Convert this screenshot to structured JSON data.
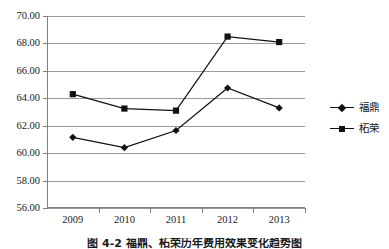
{
  "chart_data": {
    "type": "line",
    "title": "",
    "subtitle": "",
    "xlabel": "",
    "ylabel": "",
    "categories": [
      "2009",
      "2010",
      "2011",
      "2012",
      "2013"
    ],
    "series": [
      {
        "name": "福鼎",
        "marker": "diamond",
        "color": "#111111",
        "values": [
          61.15,
          60.4,
          61.65,
          64.75,
          63.3
        ]
      },
      {
        "name": "柘荣",
        "marker": "square",
        "color": "#111111",
        "values": [
          64.3,
          63.25,
          63.1,
          68.5,
          68.1
        ]
      }
    ],
    "ylim": [
      56.0,
      70.0
    ],
    "ystep": 2.0,
    "ytick_labels": [
      "70.00",
      "68.00",
      "66.00",
      "64.00",
      "62.00",
      "60.00",
      "58.00",
      "56.00"
    ],
    "ytick_values": [
      70.0,
      68.0,
      66.0,
      64.0,
      62.0,
      60.0,
      58.0,
      56.0
    ],
    "grid": true,
    "grid_axis": "y",
    "legend_position": "right"
  },
  "legend": {
    "entries": [
      {
        "label": "福鼎",
        "marker": "diamond"
      },
      {
        "label": "柘荣",
        "marker": "square"
      }
    ]
  },
  "caption": {
    "text": "图 4-2  福鼎、柘荣历年费用效果变化趋势图"
  },
  "colors": {
    "grid": "#9a9a9a",
    "axis": "#808080",
    "series": "#111111",
    "background": "#ffffff"
  }
}
